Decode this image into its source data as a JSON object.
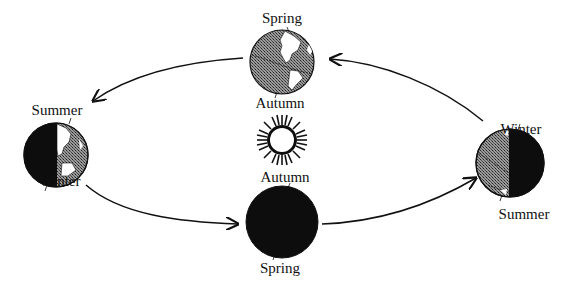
{
  "sun": {
    "name": "Sun",
    "fill": "#ffffff",
    "ray_color": "#111111"
  },
  "globes": [
    {
      "id": "top",
      "position": "top",
      "top_label": "Spring",
      "bottom_label": "Autumn",
      "shading": "fully-lit"
    },
    {
      "id": "left",
      "position": "left",
      "top_label": "Summer",
      "bottom_label": "Winter",
      "shading": "left-half-dark"
    },
    {
      "id": "bottom",
      "position": "bottom",
      "top_label": "Autumn",
      "bottom_label": "Spring",
      "shading": "fully-dark"
    },
    {
      "id": "right",
      "position": "right",
      "top_label": "Winter",
      "bottom_label": "Summer",
      "shading": "right-half-dark"
    }
  ],
  "orbit": {
    "direction": "counter-clockwise",
    "arrows": [
      "top-to-left",
      "left-to-bottom",
      "bottom-to-right",
      "right-to-top"
    ]
  },
  "colors": {
    "ink": "#111111",
    "lit_ocean": "#6e6e6e",
    "land": "#ffffff",
    "dark": "#0d0d0d"
  }
}
